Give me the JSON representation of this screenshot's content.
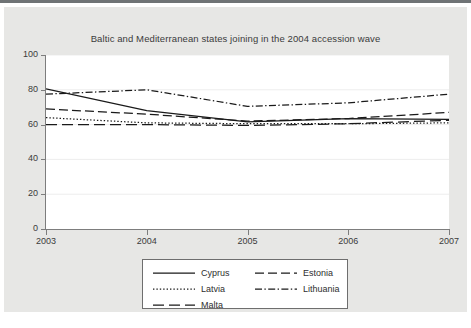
{
  "figure": {
    "title": "Baltic and Mediterranean states joining in the 2004 accession wave",
    "panel_bg": "#e7e7e5",
    "plot_bg": "#ffffff",
    "axis_color": "#7d7d7d",
    "line_color": "#1a1a1a"
  },
  "chart_data": {
    "type": "line",
    "title": "Baltic and Mediterranean states joining in the 2004 accession wave",
    "xlabel": "",
    "ylabel": "",
    "x": [
      2003,
      2004,
      2005,
      2006,
      2007
    ],
    "xtick_labels": [
      "2003",
      "2004",
      "2005",
      "2006",
      "2007"
    ],
    "ytick_labels": [
      "0",
      "20",
      "40",
      "60",
      "80",
      "100"
    ],
    "ytick_values": [
      0,
      20,
      40,
      60,
      80,
      100
    ],
    "xlim": [
      2003,
      2007
    ],
    "ylim": [
      0,
      100
    ],
    "grid": true,
    "legend_position": "below",
    "series": [
      {
        "name": "Cyprus",
        "style": "solid",
        "values": [
          80.5,
          68.0,
          61.5,
          63.5,
          63.0
        ]
      },
      {
        "name": "Estonia",
        "style": "dashed",
        "values": [
          69.0,
          66.0,
          62.0,
          63.5,
          67.0
        ]
      },
      {
        "name": "Latvia",
        "style": "dotted",
        "values": [
          64.0,
          61.0,
          60.5,
          60.5,
          61.0
        ]
      },
      {
        "name": "Lithuania",
        "style": "dashdot",
        "values": [
          77.5,
          80.0,
          70.5,
          72.5,
          77.5
        ]
      },
      {
        "name": "Malta",
        "style": "longdash",
        "values": [
          60.0,
          60.0,
          59.5,
          60.5,
          62.5
        ]
      }
    ]
  },
  "legend": {
    "entries": [
      {
        "label": "Cyprus",
        "style": "solid"
      },
      {
        "label": "Estonia",
        "style": "dashed"
      },
      {
        "label": "Latvia",
        "style": "dotted"
      },
      {
        "label": "Lithuania",
        "style": "dashdot"
      },
      {
        "label": "Malta",
        "style": "longdash"
      }
    ]
  }
}
